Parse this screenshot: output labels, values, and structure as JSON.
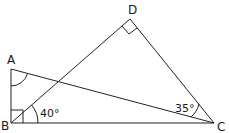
{
  "diagram": {
    "points": {
      "A": {
        "label": "A"
      },
      "B": {
        "label": "B"
      },
      "C": {
        "label": "C"
      },
      "D": {
        "label": "D"
      }
    },
    "segments": [
      "AB",
      "BC",
      "AC",
      "BD",
      "DC"
    ],
    "angles": {
      "DBC": "40°",
      "ACB": "35°"
    },
    "right_angles": [
      "ABC",
      "BDC"
    ],
    "marked_angles": [
      "BAC"
    ]
  }
}
